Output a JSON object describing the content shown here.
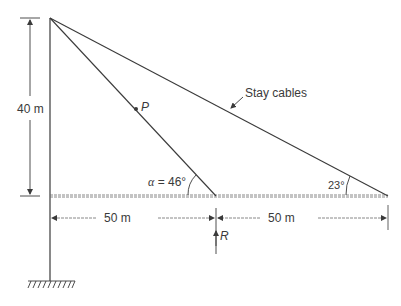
{
  "diagram": {
    "type": "cable-stayed structure",
    "labels": {
      "height": "40 m",
      "span_left": "50 m",
      "span_right": "50 m",
      "force_P": "P",
      "reaction_R": "R",
      "alpha_symbol": "α",
      "alpha_value": " = 46°",
      "angle_right": "23°",
      "callout": "Stay cables"
    },
    "colors": {
      "line": "#3a3a3a",
      "dashed": "#6a6a6a",
      "text": "#3a3a3a"
    }
  }
}
